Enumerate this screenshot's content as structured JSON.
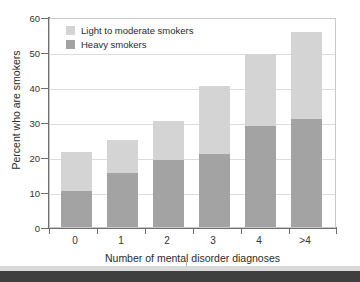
{
  "chart_data": {
    "type": "bar",
    "stacked": true,
    "title": "",
    "xlabel": "Number of mental disorder diagnoses",
    "ylabel": "Percent who are smokers",
    "categories": [
      "0",
      "1",
      "2",
      "3",
      "4",
      ">4"
    ],
    "ylim": [
      0,
      60
    ],
    "yticks": [
      0,
      10,
      20,
      30,
      40,
      50,
      60
    ],
    "ytick_labels": [
      "0",
      "10",
      "20",
      "30",
      "40",
      "50",
      "60"
    ],
    "grid": true,
    "legend_position": "top-left",
    "series": [
      {
        "name": "Heavy smokers",
        "color": "#a3a3a3",
        "values": [
          10.2,
          15.5,
          19.2,
          21.0,
          28.9,
          30.8
        ]
      },
      {
        "name": "Light to moderate smokers",
        "color": "#d4d4d4",
        "values": [
          11.1,
          9.4,
          11.1,
          19.2,
          20.4,
          24.8
        ]
      }
    ],
    "totals": [
      21.3,
      24.9,
      30.3,
      40.2,
      49.3,
      55.6
    ]
  },
  "legend": {
    "items": [
      {
        "label": "Light to moderate smokers",
        "color": "#d4d4d4"
      },
      {
        "label": "Heavy smokers",
        "color": "#a3a3a3"
      }
    ]
  },
  "axes": {
    "y_title": "Percent who are smokers",
    "x_title": "Number of mental disorder diagnoses",
    "y_labels": [
      "60",
      "50",
      "40",
      "30",
      "20",
      "10",
      "0"
    ],
    "x_labels": [
      "0",
      "1",
      "2",
      "3",
      "4",
      ">4"
    ]
  },
  "colors": {
    "light_smokers": "#d4d4d4",
    "heavy_smokers": "#a3a3a3",
    "grid": "#dcdcdc",
    "axis": "#6e6e6e",
    "text": "#2b2b2b",
    "background": "#ffffff"
  }
}
